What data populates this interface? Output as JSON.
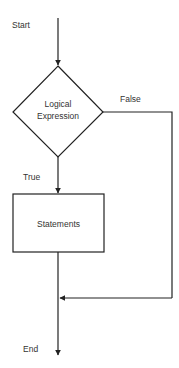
{
  "diagram": {
    "type": "flowchart",
    "title": "",
    "nodes": [
      {
        "id": "start",
        "shape": "terminal-label",
        "label": "Start"
      },
      {
        "id": "decision",
        "shape": "diamond",
        "label_lines": [
          "Logical",
          "Expression"
        ]
      },
      {
        "id": "statements",
        "shape": "rectangle",
        "label": "Statements"
      },
      {
        "id": "end",
        "shape": "terminal-label",
        "label": "End"
      }
    ],
    "edges": [
      {
        "from": "start",
        "to": "decision",
        "label": ""
      },
      {
        "from": "decision",
        "to": "statements",
        "label": "True"
      },
      {
        "from": "decision",
        "to": "merge",
        "label": "False"
      },
      {
        "from": "statements",
        "to": "end",
        "label": ""
      }
    ],
    "labels": {
      "start": "Start",
      "decision_line1": "Logical",
      "decision_line2": "Expression",
      "false_branch": "False",
      "true_branch": "True",
      "statements": "Statements",
      "end": "End"
    },
    "colors": {
      "stroke": "#222222",
      "text": "#333333",
      "background": "#ffffff"
    }
  }
}
